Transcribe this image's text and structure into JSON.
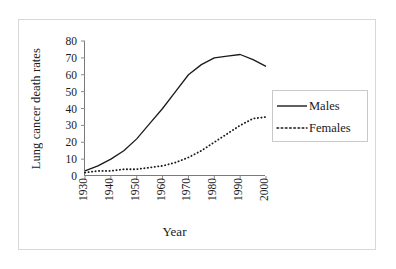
{
  "chart_data": {
    "type": "line",
    "title": "",
    "xlabel": "Year",
    "ylabel": "Lung cancer death rates",
    "xlim": [
      1930,
      2000
    ],
    "ylim": [
      0,
      80
    ],
    "ytick_labels": [
      "80",
      "70",
      "60",
      "50",
      "40",
      "30",
      "20",
      "10",
      "0"
    ],
    "ytick_values": [
      80,
      70,
      60,
      50,
      40,
      30,
      20,
      10,
      0
    ],
    "xtick_labels": [
      "1930",
      "1940",
      "1950",
      "1960",
      "1970",
      "1980",
      "1990",
      "2000"
    ],
    "xtick_values": [
      1930,
      1940,
      1950,
      1960,
      1970,
      1980,
      1990,
      2000
    ],
    "grid": false,
    "legend_position": "right",
    "x": [
      1930,
      1935,
      1940,
      1945,
      1950,
      1955,
      1960,
      1965,
      1970,
      1975,
      1980,
      1985,
      1990,
      1995,
      2000
    ],
    "series": [
      {
        "name": "Males",
        "style": "solid",
        "color": "#1a1a1a",
        "values": [
          3,
          6,
          10,
          15,
          22,
          31,
          40,
          50,
          60,
          66,
          70,
          71,
          72,
          69,
          65
        ]
      },
      {
        "name": "Females",
        "style": "dotted",
        "color": "#1a1a1a",
        "values": [
          2,
          3,
          3,
          4,
          4,
          5,
          6,
          8,
          11,
          15,
          20,
          25,
          30,
          34,
          35
        ]
      }
    ]
  },
  "legend": {
    "entries": [
      {
        "label": "Males"
      },
      {
        "label": "Females"
      }
    ]
  }
}
